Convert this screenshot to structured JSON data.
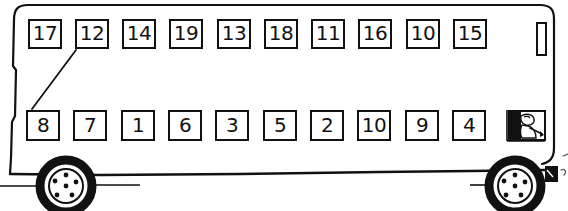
{
  "scene": {
    "title": "Hand-drawn double-decker bus seating diagram",
    "width": 568,
    "height": 211,
    "ink_color": "#111111",
    "paper_color": "#ffffff"
  },
  "bus": {
    "body_label": "bus-body",
    "roof_label": "bus-roof",
    "front_label": "bus-front",
    "rear_label": "bus-rear",
    "wheels": [
      {
        "name": "front-wheel",
        "cx": 66,
        "cy": 186,
        "r": 26,
        "hub_r": 16,
        "bolts": 5
      },
      {
        "name": "rear-wheel",
        "cx": 515,
        "cy": 186,
        "r": 26,
        "hub_r": 16,
        "bolts": 5
      }
    ],
    "side_window": {
      "x": 536,
      "y": 22,
      "w": 11,
      "h": 34
    },
    "mudflap": {
      "x": 546,
      "y": 168,
      "w": 12,
      "h": 14
    }
  },
  "seats": {
    "top_row": {
      "name": "upper-deck-seat-row",
      "y": 19,
      "start_x": 28,
      "pitch": 47.2,
      "labels": [
        "17",
        "12",
        "14",
        "19",
        "13",
        "18",
        "11",
        "16",
        "10",
        "15"
      ]
    },
    "bottom_row": {
      "name": "lower-deck-seat-row",
      "y": 110,
      "start_x": 26,
      "pitch": 47.2,
      "labels": [
        "8",
        "7",
        "1",
        "6",
        "3",
        "5",
        "2",
        "10",
        "9",
        "4"
      ]
    }
  },
  "connector": {
    "name": "seat-pairing-line",
    "from_seat": "12",
    "to_seat": "8",
    "x1": 76,
    "y1": 50,
    "x2": 32,
    "y2": 109
  },
  "driver": {
    "name": "driver-figure",
    "window": {
      "x": 508,
      "y": 110,
      "w": 38,
      "h": 31
    },
    "description": "driver seated in profile facing forward"
  }
}
